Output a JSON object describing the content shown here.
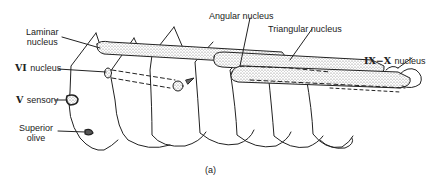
{
  "figure": {
    "caption": "(a)",
    "labels": {
      "laminar": [
        "Laminar",
        "nucleus"
      ],
      "vi_roman": "VI",
      "vi_word": "nucleus",
      "v_roman": "V",
      "v_word": "sensory",
      "superior_olive": [
        "Superior",
        "olive"
      ],
      "angular": "Angular nucleus",
      "triangular": "Triangular nucleus",
      "ixx_roman": "IX−X",
      "ixx_word": "nucleus"
    },
    "colors": {
      "line": "#222222",
      "stipple": "#888888",
      "background": "#ffffff"
    }
  }
}
